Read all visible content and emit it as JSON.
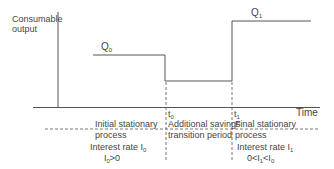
{
  "diagram": {
    "y_axis_label_line1": "Consumable",
    "y_axis_label_line2": "output",
    "x_axis_label": "Time",
    "levels": {
      "q0": {
        "symbol": "Q",
        "sub": "0"
      },
      "q1": {
        "symbol": "Q",
        "sub": "1"
      }
    },
    "time_marks": {
      "t0": {
        "symbol": "t",
        "sub": "0"
      },
      "t1": {
        "symbol": "t",
        "sub": "1"
      }
    },
    "phases": [
      {
        "title_line1": "Initial stationary",
        "title_line2": "process",
        "rate_label": "Interest rate I",
        "rate_sub": "0",
        "condition": "I0>0"
      },
      {
        "title_line1": "Additional savings",
        "title_line2": "transition period"
      },
      {
        "title_line1": "Final stationary",
        "title_line2": "process",
        "rate_label": "Interest rate I",
        "rate_sub": "1",
        "condition": "0<I1<I0"
      }
    ],
    "line_color": "#555555"
  }
}
